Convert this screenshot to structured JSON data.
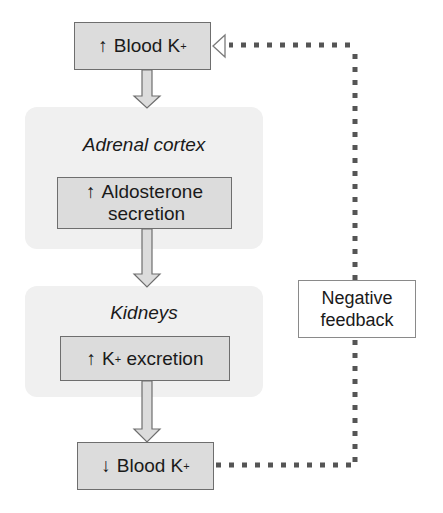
{
  "diagram": {
    "nodes": {
      "top": {
        "arrow": "↑",
        "label": "Blood K",
        "sup": "+"
      },
      "adrenal_panel": {
        "title": "Adrenal cortex"
      },
      "aldosterone": {
        "arrow": "↑",
        "line1": "Aldosterone",
        "line2": "secretion"
      },
      "kidney_panel": {
        "title": "Kidneys"
      },
      "excretion": {
        "arrow": "↑",
        "pre": "K",
        "sup": "+",
        "post": " excretion"
      },
      "bottom": {
        "arrow": "↓",
        "label": "Blood K",
        "sup": "+"
      },
      "feedback": {
        "line1": "Negative",
        "line2": "feedback"
      }
    },
    "colors": {
      "panel_bg": "#f0f0f0",
      "box_fill": "#dcdcdc",
      "box_border": "#6e6e6e",
      "arrow_fill": "#dcdcdc",
      "dotted_line": "#555555"
    }
  }
}
